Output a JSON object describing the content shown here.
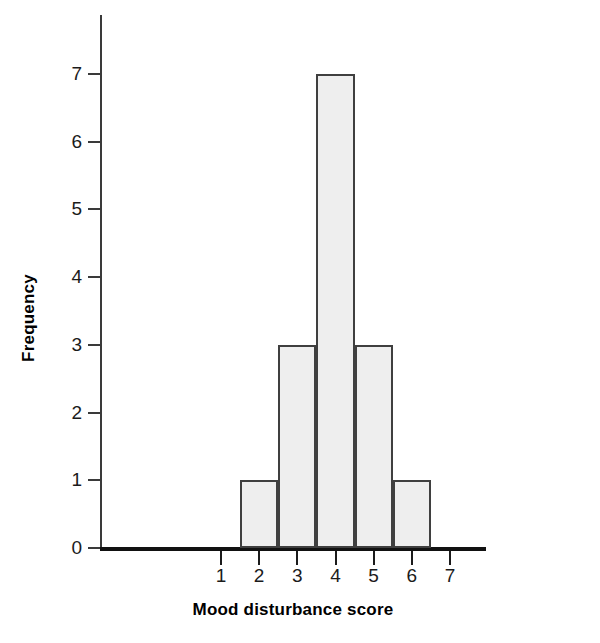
{
  "chart_data": {
    "type": "bar",
    "title": "",
    "subtitle": "",
    "xlabel": "Mood disturbance score",
    "ylabel": "Frequency",
    "categories": [
      "2",
      "3",
      "4",
      "5",
      "6"
    ],
    "values": [
      1,
      3,
      7,
      3,
      1
    ],
    "bin_edges": [
      1.5,
      2.5,
      3.5,
      4.5,
      5.5,
      6.5
    ],
    "x_tick_labels": [
      "1",
      "2",
      "3",
      "4",
      "5",
      "6",
      "7"
    ],
    "x_tick_values": [
      1,
      2,
      3,
      4,
      5,
      6,
      7
    ],
    "y_tick_labels": [
      "0",
      "1",
      "2",
      "3",
      "4",
      "5",
      "6",
      "7"
    ],
    "y_tick_values": [
      0,
      1,
      2,
      3,
      4,
      5,
      6,
      7
    ],
    "xlim": [
      0.35,
      7.6
    ],
    "ylim": [
      0,
      7.85
    ],
    "grid": false,
    "legend": null,
    "bar_fill_color": "#eeeeee",
    "bar_edge_color": "#3f3f3f",
    "axis_color": "#1b1b1b",
    "background_color": "#ffffff"
  }
}
